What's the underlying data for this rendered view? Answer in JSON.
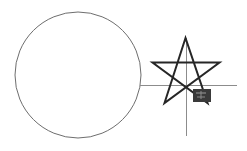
{
  "canvas": {
    "width": 247,
    "height": 151,
    "background_color": "#ffffff",
    "title": "Geometric line drawing"
  },
  "chart_data": {
    "type": "scatter",
    "xlabel": "",
    "ylabel": "",
    "xlim": [
      0,
      247
    ],
    "ylim": [
      0,
      151
    ],
    "grid": false,
    "legend": false,
    "annotations": [
      "large thin-stroked circle at left",
      "five-pointed pentagram star at right",
      "thin horizontal line crossing from circle edge through star",
      "thin vertical line crossing star from top point downward",
      "small dark filled rectangle at star lower-right"
    ]
  },
  "shapes": {
    "circle": {
      "name": "circle",
      "center_x": 78,
      "center_y": 75,
      "radius": 63,
      "stroke_color": "#6e6e6e",
      "stroke_width": 1,
      "fill": "none"
    },
    "star": {
      "name": "pentagram-star",
      "center_x": 186,
      "center_y": 72,
      "outer_radius": 35,
      "points": 5,
      "stroke_color": "#262626",
      "stroke_width": 2,
      "fill": "none",
      "path": "M 185.5 38 L 164.5 103 L 219.5 62.5 L 152.5 62.5 L 207.5 103 Z"
    },
    "horizontal_line": {
      "name": "horizontal-axis-line",
      "x1": 140,
      "y1": 85.5,
      "x2": 237,
      "y2": 85.5,
      "stroke_color": "#8c8c8c",
      "stroke_width": 1
    },
    "vertical_line": {
      "name": "vertical-axis-line",
      "x1": 186.5,
      "y1": 38,
      "x2": 186.5,
      "y2": 136,
      "stroke_color": "#8c8c8c",
      "stroke_width": 1
    },
    "marker": {
      "name": "marker-rectangle",
      "x": 193,
      "y": 89,
      "width": 18,
      "height": 13,
      "fill_color": "#3a3a3a",
      "detail_color": "#8f8f8f"
    }
  }
}
